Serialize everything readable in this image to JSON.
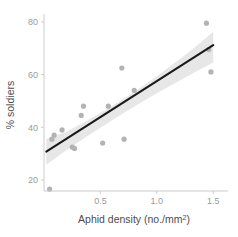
{
  "chart_data": {
    "type": "scatter",
    "title": "",
    "subtitle": "",
    "xlabel": "Aphid density (no./mm2)",
    "xlabel_base": "Aphid density (no./mm",
    "xlabel_sup": "2",
    "xlabel_tail": ")",
    "ylabel": "% soldiers",
    "xlim": [
      0.0,
      1.52
    ],
    "ylim": [
      14.0,
      82.0
    ],
    "xticks": [
      0.5,
      1.0,
      1.5
    ],
    "xtick_labels": [
      "0.5",
      "1.0",
      "1.5"
    ],
    "yticks": [
      20,
      40,
      60,
      80
    ],
    "ytick_labels": [
      "20",
      "40",
      "60",
      "80"
    ],
    "grid": false,
    "legend": "none",
    "point_color": "#b3b3b3",
    "line_color": "#1a1a1a",
    "band_color": "#d9d9d9",
    "axis_color": "#cccccc",
    "tick_label_color": "#9a9a9a",
    "axis_title_color": "#4d4d4d",
    "background": "#ffffff",
    "points": [
      {
        "x": 0.05,
        "y": 16.5
      },
      {
        "x": 0.07,
        "y": 35.5
      },
      {
        "x": 0.09,
        "y": 37.0
      },
      {
        "x": 0.16,
        "y": 39.0
      },
      {
        "x": 0.25,
        "y": 32.5
      },
      {
        "x": 0.27,
        "y": 32.0
      },
      {
        "x": 0.33,
        "y": 44.5
      },
      {
        "x": 0.35,
        "y": 48.0
      },
      {
        "x": 0.52,
        "y": 34.0
      },
      {
        "x": 0.57,
        "y": 48.0
      },
      {
        "x": 0.69,
        "y": 62.5
      },
      {
        "x": 0.71,
        "y": 35.5
      },
      {
        "x": 0.8,
        "y": 54.0
      },
      {
        "x": 1.44,
        "y": 79.5
      },
      {
        "x": 1.46,
        "y": 69.5
      },
      {
        "x": 1.48,
        "y": 61.0
      }
    ],
    "fit_line": {
      "x": [
        0.02,
        1.5
      ],
      "y": [
        30.8,
        71.2
      ]
    },
    "confidence_band": {
      "x": [
        0.02,
        0.2,
        0.4,
        0.6,
        0.8,
        1.0,
        1.2,
        1.35,
        1.5
      ],
      "upper": [
        35.6,
        38.3,
        43.0,
        48.0,
        53.4,
        59.4,
        65.8,
        70.8,
        76.3
      ],
      "lower": [
        25.8,
        31.4,
        37.1,
        42.6,
        47.9,
        52.9,
        57.7,
        61.2,
        64.6
      ]
    }
  }
}
